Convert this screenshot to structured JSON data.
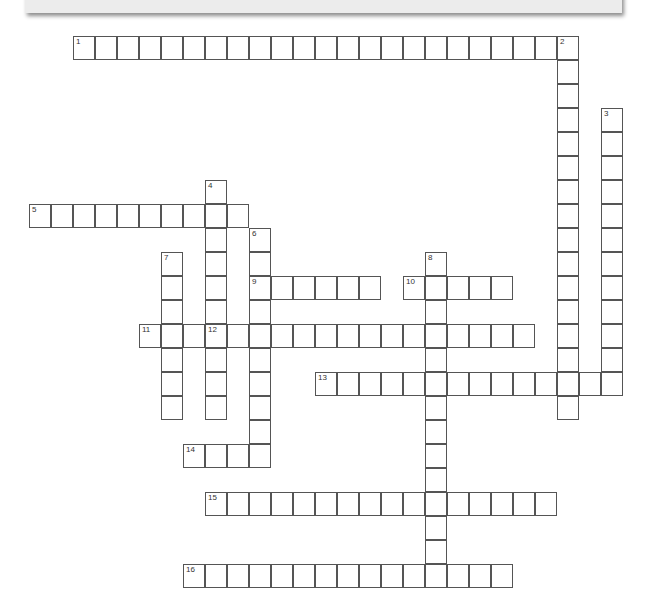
{
  "puzzle": {
    "type": "crossword",
    "banner_label": "",
    "entries": [
      {
        "number": "1",
        "direction": "across",
        "col": 2,
        "row": 0,
        "length": 23
      },
      {
        "number": "2",
        "direction": "down",
        "col": 24,
        "row": 0,
        "length": 16
      },
      {
        "number": "3",
        "direction": "down",
        "col": 26,
        "row": 3,
        "length": 12
      },
      {
        "number": "4",
        "direction": "down",
        "col": 8,
        "row": 6,
        "length": 10
      },
      {
        "number": "5",
        "direction": "across",
        "col": 0,
        "row": 7,
        "length": 10
      },
      {
        "number": "6",
        "direction": "down",
        "col": 10,
        "row": 8,
        "length": 10
      },
      {
        "number": "7",
        "direction": "down",
        "col": 6,
        "row": 9,
        "length": 7
      },
      {
        "number": "8",
        "direction": "down",
        "col": 18,
        "row": 9,
        "length": 14
      },
      {
        "number": "9",
        "direction": "across",
        "col": 10,
        "row": 10,
        "length": 6
      },
      {
        "number": "10",
        "direction": "across",
        "col": 17,
        "row": 10,
        "length": 5
      },
      {
        "number": "11",
        "direction": "across",
        "col": 5,
        "row": 12,
        "length": 18
      },
      {
        "number": "12",
        "direction": "label",
        "col": 8,
        "row": 12,
        "length": 1
      },
      {
        "number": "13",
        "direction": "across",
        "col": 13,
        "row": 14,
        "length": 14
      },
      {
        "number": "14",
        "direction": "across",
        "col": 7,
        "row": 17,
        "length": 4
      },
      {
        "number": "15",
        "direction": "across",
        "col": 8,
        "row": 19,
        "length": 16
      },
      {
        "number": "16",
        "direction": "across",
        "col": 7,
        "row": 22,
        "length": 15
      }
    ],
    "colors": {
      "cell_border": "#555555",
      "cell_fill": "#ffffff",
      "banner": "#ececec"
    }
  }
}
